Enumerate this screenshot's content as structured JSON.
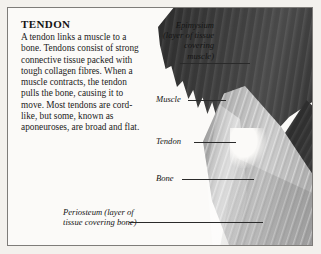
{
  "figure": {
    "heading": "TENDON",
    "body": "A tendon links a muscle to a bone. Tendons consist of strong connective tissue packed with tough collagen fibres. When a muscle contracts, the tendon pulls the bone, causing it to move. Most tendons are cord-like, but some, known as aponeuroses, are broad and flat."
  },
  "labels": {
    "epimysium": "Epimysium\n(layer of tissue\ncovering\nmuscle)",
    "muscle": "Muscle",
    "tendon": "Tendon",
    "bone": "Bone",
    "periosteum": "Periosteum (layer of\ntissue covering bone)"
  },
  "colors": {
    "page_background": "#f3f1ed",
    "frame_background": "#fbfaf8",
    "frame_border": "#7e7c79",
    "text": "#141414",
    "muscle_dark": "#3a3a3a",
    "bone_grey": "#a8a8a8",
    "leader_line": "#2a2a2a"
  }
}
